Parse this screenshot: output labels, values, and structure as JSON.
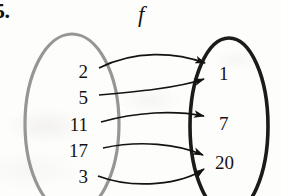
{
  "figure": {
    "exercise_number": "5.",
    "function_name": "f",
    "type": "mapping-diagram",
    "domain": {
      "name": "domain-oval",
      "outline_color": "#8d8d8a",
      "elements": [
        {
          "value": "2",
          "x": 88,
          "y": 71
        },
        {
          "value": "5",
          "x": 88,
          "y": 97
        },
        {
          "value": "11",
          "x": 88,
          "y": 124
        },
        {
          "value": "17",
          "x": 88,
          "y": 150
        },
        {
          "value": "3",
          "x": 88,
          "y": 176
        }
      ]
    },
    "codomain": {
      "name": "codomain-oval",
      "outline_color": "#1d1b18",
      "elements": [
        {
          "value": "1",
          "x": 224,
          "y": 74
        },
        {
          "value": "7",
          "x": 224,
          "y": 124
        },
        {
          "value": "20",
          "x": 222,
          "y": 164
        }
      ]
    },
    "arrows": [
      {
        "from": "2",
        "to": "1",
        "color": "#141310"
      },
      {
        "from": "5",
        "to": "1",
        "color": "#141310"
      },
      {
        "from": "11",
        "to": "7",
        "color": "#141310"
      },
      {
        "from": "17",
        "to": "20",
        "color": "#141310"
      },
      {
        "from": "3",
        "to": "20",
        "color": "#141310"
      }
    ],
    "mappings_text": "2→1, 5→1, 11→7, 17→20, 3→20"
  }
}
